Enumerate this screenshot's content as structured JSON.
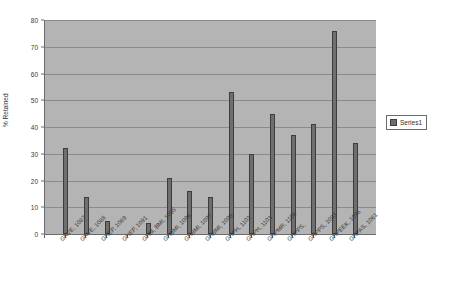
{
  "chart_data": {
    "type": "bar",
    "title": "",
    "xlabel": "",
    "ylabel": "% Retained",
    "ylim": [
      0,
      80
    ],
    "ytick_step": 10,
    "grid": true,
    "legend_position": "right",
    "series": [
      {
        "name": "Series1",
        "color": "#6e6e6e",
        "values": [
          32,
          14,
          5,
          0,
          4,
          21,
          16,
          14,
          53,
          30,
          45,
          37,
          41,
          76,
          34
        ]
      }
    ],
    "categories": [
      "GKVE, 1087",
      "GKVE, 1088",
      "GHEP, 1089",
      "GHEP, 1091",
      "GHM, BMI, 1095",
      "GHBMI, 1096",
      "GHBMI, 1097",
      "GHBMI, 1098",
      "GHPH, 1102",
      "GHPH, 1103",
      "GHPMR, 1106",
      "GHPPS,",
      "GHPPS, 1093",
      "GHPEEK, 1096",
      "GHPAS, 1061"
    ],
    "ytick_labels": [
      "0",
      "10",
      "20",
      "30",
      "40",
      "50",
      "60",
      "70",
      "80"
    ],
    "colors": {
      "plot_background": "#b4b4b4",
      "gridline": "#8a8a8a",
      "axis": "#6b6b6b",
      "bar_fill": "#6e6e6e",
      "bar_border": "#3d3d3d",
      "page_background": "#ffffff",
      "text": "#3a3a3a"
    }
  },
  "legend": {
    "entries": [
      {
        "label": "Series1"
      }
    ]
  }
}
